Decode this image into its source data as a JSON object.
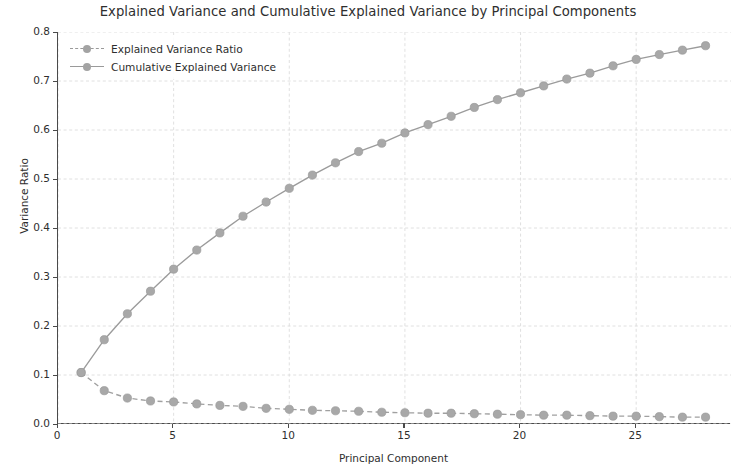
{
  "chart_data": {
    "type": "line",
    "title": "Explained Variance and Cumulative Explained Variance by Principal Components",
    "xlabel": "Principal Component",
    "ylabel": "Variance Ratio",
    "xlim": [
      0,
      29.1
    ],
    "ylim": [
      0.0,
      0.8
    ],
    "grid": true,
    "legend_position": "upper left",
    "xticks": [
      0,
      5,
      10,
      15,
      20,
      25
    ],
    "xtick_labels": [
      "0",
      "5",
      "10",
      "15",
      "20",
      "25"
    ],
    "yticks": [
      0.0,
      0.1,
      0.2,
      0.3,
      0.4,
      0.5,
      0.6,
      0.7,
      0.8
    ],
    "ytick_labels": [
      "0.0",
      "0.1",
      "0.2",
      "0.3",
      "0.4",
      "0.5",
      "0.6",
      "0.7",
      "0.8"
    ],
    "x": [
      1,
      2,
      3,
      4,
      5,
      6,
      7,
      8,
      9,
      10,
      11,
      12,
      13,
      14,
      15,
      16,
      17,
      18,
      19,
      20,
      21,
      22,
      23,
      24,
      25,
      26,
      27,
      28
    ],
    "series": [
      {
        "name": "Explained Variance Ratio",
        "style": "dashed",
        "marker": "circle",
        "color": "#a0a0a0",
        "values": [
          0.105,
          0.068,
          0.053,
          0.047,
          0.045,
          0.041,
          0.038,
          0.036,
          0.032,
          0.03,
          0.028,
          0.027,
          0.026,
          0.024,
          0.023,
          0.022,
          0.022,
          0.021,
          0.02,
          0.019,
          0.018,
          0.018,
          0.017,
          0.016,
          0.016,
          0.015,
          0.014,
          0.014
        ]
      },
      {
        "name": "Cumulative Explained Variance",
        "style": "solid",
        "marker": "circle",
        "color": "#9b9b9b",
        "values": [
          0.105,
          0.172,
          0.225,
          0.271,
          0.316,
          0.355,
          0.39,
          0.424,
          0.453,
          0.481,
          0.508,
          0.533,
          0.556,
          0.573,
          0.594,
          0.611,
          0.628,
          0.646,
          0.662,
          0.676,
          0.69,
          0.704,
          0.716,
          0.731,
          0.744,
          0.754,
          0.763,
          0.772
        ]
      }
    ]
  },
  "legend": {
    "entries": [
      {
        "label": "Explained Variance Ratio"
      },
      {
        "label": "Cumulative Explained Variance"
      }
    ]
  }
}
